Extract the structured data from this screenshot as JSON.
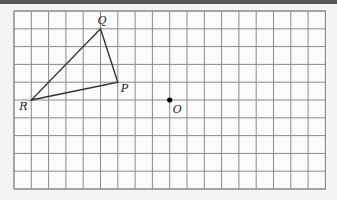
{
  "diagram": {
    "grid": {
      "cols": 18,
      "rows": 10,
      "origin_px": [
        14,
        11
      ],
      "cell_px": [
        17.3,
        17.8
      ],
      "line_color": "#8a8a8a"
    },
    "points": [
      {
        "name": "Q",
        "grid": [
          5,
          1
        ]
      },
      {
        "name": "P",
        "grid": [
          6,
          4
        ]
      },
      {
        "name": "R",
        "grid": [
          1,
          5
        ]
      },
      {
        "name": "O",
        "grid": [
          9,
          5
        ]
      }
    ],
    "triangle": [
      "P",
      "Q",
      "R"
    ],
    "labels": {
      "Q": "Q",
      "P": "P",
      "R": "R",
      "O": "O"
    }
  }
}
